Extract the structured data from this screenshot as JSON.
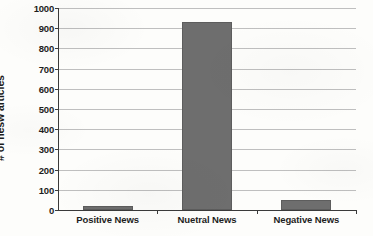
{
  "chart_data": {
    "type": "bar",
    "title": "",
    "subtitle": "",
    "xlabel": "",
    "ylabel": "# of nesw articles",
    "categories": [
      "Positive News",
      "Nuetral News",
      "Negative News"
    ],
    "values": [
      20,
      930,
      48
    ],
    "ylim": [
      0,
      1000
    ],
    "ytick_labels": [
      "1000",
      "900",
      "800",
      "700",
      "600",
      "500",
      "400",
      "300",
      "200",
      "100",
      "0"
    ],
    "ytick_values": [
      1000,
      900,
      800,
      700,
      600,
      500,
      400,
      300,
      200,
      100,
      0
    ],
    "ytick_interval": 100,
    "grid": true,
    "grid_axis": "y",
    "legend": false,
    "legend_position": "none",
    "orientation": "vertical",
    "series": [
      {
        "name": "# of nesw articles",
        "values": [
          20,
          930,
          48
        ],
        "color": "#6E6E6E"
      }
    ],
    "annotations": []
  },
  "style": {
    "bar_color": "#6E6E6E",
    "bar_border_color": "#5D5D5D",
    "gridline_color": "#9A9A9A",
    "axis_color": "#3A3A3A",
    "text_color": "#1D1D1D",
    "background_color": "#FDFDFB"
  }
}
